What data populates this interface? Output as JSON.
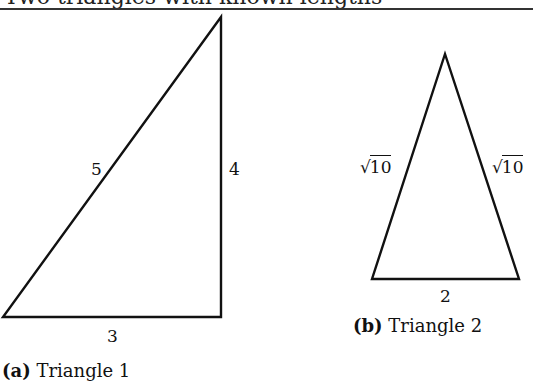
{
  "title": "Two triangles with known lengths",
  "figures": [
    {
      "id": "a",
      "caption_tag": "(a)",
      "caption_text": "Triangle 1",
      "vertices": [
        [
          3,
          317
        ],
        [
          221,
          317
        ],
        [
          221,
          17
        ]
      ],
      "side_labels": {
        "hypotenuse": "5",
        "vertical": "4",
        "base": "3"
      }
    },
    {
      "id": "b",
      "caption_tag": "(b)",
      "caption_text": "Triangle 2",
      "vertices": [
        [
          372,
          279
        ],
        [
          519,
          279
        ],
        [
          445,
          54
        ]
      ],
      "side_labels": {
        "left_radical": "√",
        "left_radicand": "10",
        "right_radical": "√",
        "right_radicand": "10",
        "base": "2"
      }
    }
  ],
  "style": {
    "stroke_color": "#111111",
    "rule_color": "#333333",
    "background": "#ffffff"
  }
}
